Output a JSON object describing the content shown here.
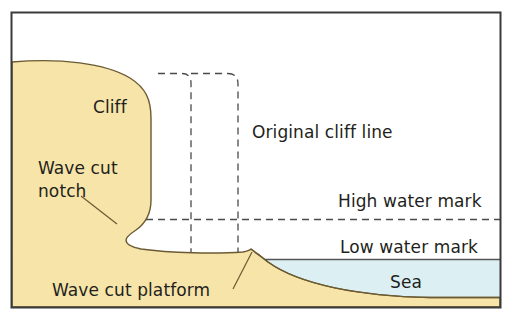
{
  "figure": {
    "kind": "coastal-erosion-cross-section",
    "title_visible": false,
    "frame": {
      "border_color": "#3a3a3a",
      "background": "#ffffff"
    },
    "colors": {
      "land": "#f7e4a8",
      "land_outline": "#6b5a33",
      "sea": "#dcf0f3",
      "sea_outline": "#555555",
      "dashed_line": "#4a4a4a",
      "text": "#231f20",
      "leader_line": "#6b5a33"
    }
  },
  "labels": {
    "cliff": "Cliff",
    "wave_cut_notch_line1": "Wave cut",
    "wave_cut_notch_line2": "notch",
    "wave_cut_platform": "Wave cut platform",
    "original_cliff_line": "Original cliff line",
    "high_water_mark": "High water mark",
    "low_water_mark": "Low water mark",
    "sea": "Sea"
  },
  "features": {
    "dashed_original_profile": {
      "description": "Dashed outline showing the former position of the cliff face",
      "style": "dashed"
    },
    "high_water_mark_line": {
      "style": "dashed",
      "orientation": "horizontal"
    },
    "low_water_mark_line": {
      "style": "solid",
      "orientation": "horizontal"
    }
  }
}
